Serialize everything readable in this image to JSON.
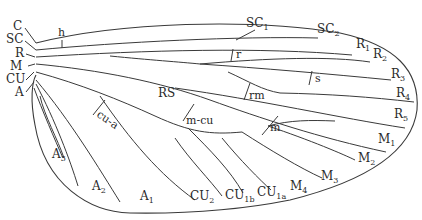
{
  "diagram": {
    "colors": {
      "line": "#3a3a3a",
      "text": "#2a2a2a",
      "background": "#ffffff"
    },
    "base_labels": {
      "C": "C",
      "SC": "SC",
      "R": "R",
      "M": "M",
      "CU": "CU",
      "A": "A"
    },
    "crossvein_labels": {
      "h": "h",
      "r": "r",
      "s": "s",
      "rm": "rm",
      "m": "m",
      "m_cu": "m-cu",
      "cu_a": "cu-a"
    },
    "sector_labels": {
      "RS": "RS"
    },
    "terminal_labels": {
      "SC1": {
        "base": "SC",
        "sub": "1"
      },
      "SC2": {
        "base": "SC",
        "sub": "2"
      },
      "R1": {
        "base": "R",
        "sub": "1"
      },
      "R2": {
        "base": "R",
        "sub": "2"
      },
      "R3": {
        "base": "R",
        "sub": "3"
      },
      "R4": {
        "base": "R",
        "sub": "4"
      },
      "R5": {
        "base": "R",
        "sub": "5"
      },
      "M1": {
        "base": "M",
        "sub": "1"
      },
      "M2": {
        "base": "M",
        "sub": "2"
      },
      "M3": {
        "base": "M",
        "sub": "3"
      },
      "M4": {
        "base": "M",
        "sub": "4"
      },
      "CU1a": {
        "base": "CU",
        "sub": "1a"
      },
      "CU1b": {
        "base": "CU",
        "sub": "1b"
      },
      "CU2": {
        "base": "CU",
        "sub": "2"
      },
      "A1": {
        "base": "A",
        "sub": "1"
      },
      "A2": {
        "base": "A",
        "sub": "2"
      },
      "A3": {
        "base": "A",
        "sub": "3"
      }
    }
  }
}
